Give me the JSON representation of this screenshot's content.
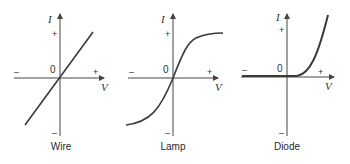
{
  "figure": {
    "panels": [
      {
        "label": "Wire",
        "y_axis": "I",
        "x_axis": "V",
        "origin": "0",
        "plus": "+",
        "minus": "–"
      },
      {
        "label": "Lamp",
        "y_axis": "I",
        "x_axis": "V",
        "origin": "0",
        "plus": "+",
        "minus": "–"
      },
      {
        "label": "Diode",
        "y_axis": "I",
        "x_axis": "V",
        "origin": "0",
        "plus": "+",
        "minus": "–"
      }
    ],
    "colors": {
      "curve": "#3a3a3a",
      "axis": "#444444"
    }
  }
}
